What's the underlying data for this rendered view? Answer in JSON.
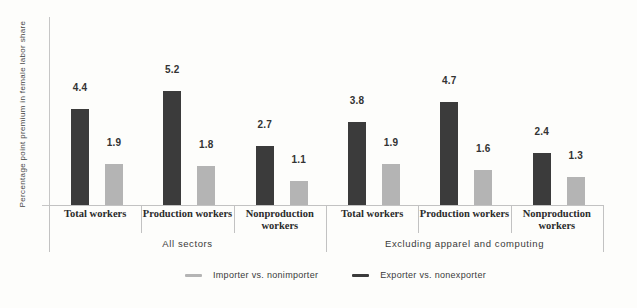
{
  "chart_data": {
    "type": "bar",
    "title": "",
    "ylabel": "Percentage point premium in female labor share",
    "xlabel": "",
    "ylim": [
      0,
      8.7
    ],
    "grid": false,
    "legend_position": "bottom",
    "series": [
      {
        "name": "Exporter vs. nonexporter",
        "color": "#3b3b3b"
      },
      {
        "name": "Importer vs. nonimporter",
        "color": "#b4b4b4"
      }
    ],
    "groups": [
      {
        "label": "All sectors",
        "categories": [
          "Total workers",
          "Production workers",
          "Nonproduction workers"
        ],
        "exporter_values": [
          4.4,
          5.2,
          2.7
        ],
        "importer_values": [
          1.9,
          1.8,
          1.1
        ]
      },
      {
        "label": "Excluding apparel and computing",
        "categories": [
          "Total workers",
          "Production workers",
          "Nonproduction workers"
        ],
        "exporter_values": [
          3.8,
          4.7,
          2.4
        ],
        "importer_values": [
          1.9,
          1.6,
          1.3
        ]
      }
    ],
    "value_labels": [
      4.4,
      1.9,
      5.2,
      1.8,
      2.7,
      1.1,
      3.8,
      1.9,
      4.7,
      1.6,
      2.4,
      1.3
    ],
    "legend": [
      {
        "label": "Importer vs. nonimporter",
        "color": "#b4b4b4"
      },
      {
        "label": "Exporter vs. nonexporter",
        "color": "#3b3b3b"
      }
    ]
  }
}
